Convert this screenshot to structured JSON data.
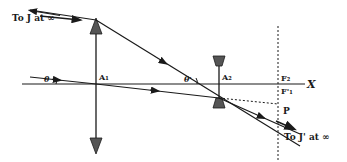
{
  "diagram": {
    "type": "optical ray diagram (Galilean telescope)",
    "labels": {
      "top_left_ray": "To J at ∞",
      "bottom_right_ray": "To J' at ∞",
      "theta": "θ",
      "theta_prime": "θ'",
      "objective_lens": "A₁",
      "eyepiece_lens": "A₂",
      "focal_point_2": "F₂",
      "focal_point_1_prime": "F'₁",
      "point_p": "P",
      "axis": "X"
    },
    "elements": {
      "objective": "converging lens at A₁",
      "eyepiece": "diverging lens at A₂",
      "focal_plane": "dotted vertical line through F₂ / F'₁"
    },
    "colors": {
      "ink": "#1a1a1a",
      "background": "#ffffff"
    }
  }
}
